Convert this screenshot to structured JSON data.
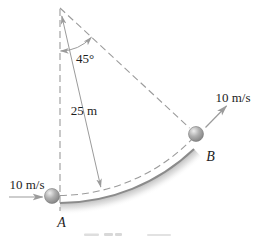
{
  "diagram": {
    "type": "physics-circular-arc-pendulum-figure",
    "angle_label": "45°",
    "radius_label": "25 m",
    "point_a": {
      "name": "A",
      "speed_label": "10 m/s"
    },
    "point_b": {
      "name": "B",
      "speed_label": "10 m/s"
    },
    "values": {
      "angle_deg": 45,
      "radius_m": 25,
      "speed_at_a_mps": 10,
      "speed_at_b_mps": 10
    },
    "colors": {
      "line_gray": "#9b9b9b",
      "track_gray": "#8b8b8b",
      "shade_gray": "#909090",
      "text": "#1d1d1d",
      "ball_highlight": "#eeeeee",
      "ball_mid": "#b0b0b0",
      "ball_edge": "#757575",
      "background": "#ffffff"
    }
  }
}
